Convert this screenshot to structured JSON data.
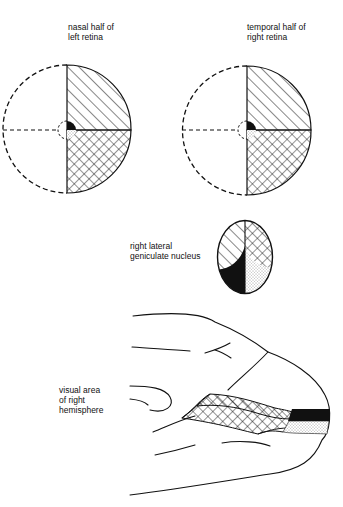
{
  "labels": {
    "left_retina": {
      "line1": "nasal half of",
      "line2": "left retina"
    },
    "right_retina": {
      "line1": "temporal half of",
      "line2": "right retina"
    },
    "lgn": {
      "line1": "right lateral",
      "line2": "geniculate nucleus"
    },
    "cortex": {
      "line1": "visual area",
      "line2": "of right",
      "line3": "hemisphere"
    }
  },
  "patterns": {
    "upper_quadrant": "diagonal-hatch",
    "lower_quadrant": "cross-hatch",
    "macula_upper": "solid-black",
    "macula_lower": "stipple"
  },
  "colors": {
    "ink": "#111111",
    "background": "#ffffff"
  }
}
